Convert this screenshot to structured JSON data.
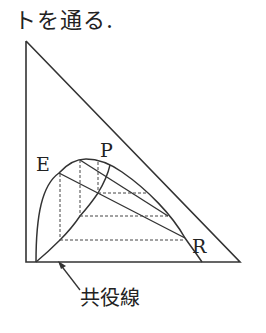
{
  "header": {
    "caption": "トを通る."
  },
  "diagram": {
    "labels": {
      "E": "E",
      "P": "P",
      "R": "R",
      "conjugate": "共役線"
    },
    "colors": {
      "line": "#333333",
      "dashed": "#444444"
    }
  }
}
